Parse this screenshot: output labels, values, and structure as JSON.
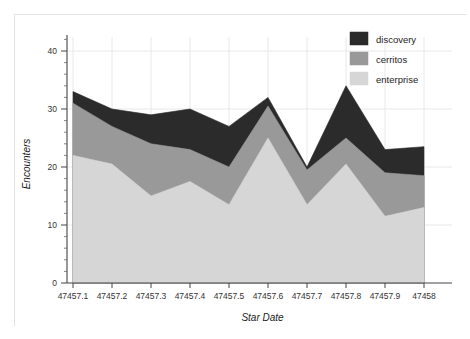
{
  "chart_data": {
    "type": "area",
    "stacked": true,
    "title": "",
    "xlabel": "Star Date",
    "ylabel": "Encounters",
    "x": [
      47457.1,
      47457.2,
      47457.3,
      47457.4,
      47457.5,
      47457.6,
      47457.7,
      47457.8,
      47457.9,
      47458
    ],
    "categories": [
      "47457.1",
      "47457.2",
      "47457.3",
      "47457.4",
      "47457.5",
      "47457.6",
      "47457.7",
      "47457.8",
      "47457.9",
      "47458"
    ],
    "series": [
      {
        "name": "enterprise",
        "color": "#d6d6d6",
        "values": [
          22,
          20.5,
          15,
          17.5,
          13.5,
          25,
          13.5,
          20.5,
          11.5,
          13
        ]
      },
      {
        "name": "cerritos",
        "color": "#999999",
        "values": [
          9,
          6.5,
          9,
          5.5,
          6.5,
          5.5,
          6,
          4.5,
          7.5,
          5.5
        ]
      },
      {
        "name": "discovery",
        "color": "#2b2b2b",
        "values": [
          2,
          3,
          5,
          7,
          7,
          1.5,
          0.5,
          9,
          4,
          5
        ]
      }
    ],
    "totals": [
      33,
      30,
      29,
      30,
      27,
      32,
      20,
      34,
      23,
      23.5
    ],
    "legend_order": [
      "discovery",
      "cerritos",
      "enterprise"
    ],
    "legend_position": "top-right",
    "grid": true,
    "xlim": [
      47457.1,
      47458
    ],
    "ylim": [
      0,
      44
    ],
    "yticks": [
      0,
      10,
      20,
      30,
      40
    ],
    "ytick_labels": [
      "0",
      "10",
      "20",
      "30",
      "40"
    ],
    "ytick_minor_step": 2,
    "xtick_labels": [
      "47457.1",
      "47457.2",
      "47457.3",
      "47457.4",
      "47457.5",
      "47457.6",
      "47457.7",
      "47457.8",
      "47457.9",
      "47458"
    ]
  },
  "legend": {
    "items": [
      {
        "label": "discovery",
        "color": "#2b2b2b"
      },
      {
        "label": "cerritos",
        "color": "#999999"
      },
      {
        "label": "enterprise",
        "color": "#d6d6d6"
      }
    ]
  },
  "axes": {
    "y_title": "Encounters",
    "x_title": "Star Date"
  },
  "colors": {
    "background": "#ffffff",
    "plot_background": "#ffffff",
    "axis": "#444444",
    "grid": "#e8e8e8",
    "text": "#222222"
  }
}
